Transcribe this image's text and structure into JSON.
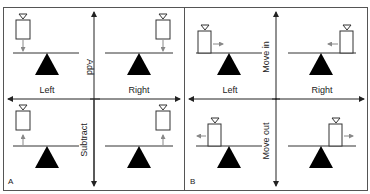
{
  "figure": {
    "panels": [
      {
        "id": "A",
        "label": "A",
        "axis_vertical_top": "Add",
        "axis_vertical_bottom": "Subtract",
        "axis_horizontal_left": "Left",
        "axis_horizontal_right": "Right",
        "quadrants": [
          {
            "position": "top-left",
            "action": "add weight on left",
            "arrow": "down"
          },
          {
            "position": "top-right",
            "action": "add weight on right",
            "arrow": "down"
          },
          {
            "position": "bottom-left",
            "action": "subtract weight on left",
            "arrow": "up"
          },
          {
            "position": "bottom-right",
            "action": "subtract weight on right",
            "arrow": "up"
          }
        ]
      },
      {
        "id": "B",
        "label": "B",
        "axis_vertical_top": "Move in",
        "axis_vertical_bottom": "Move out",
        "axis_horizontal_left": "Left",
        "axis_horizontal_right": "Right",
        "quadrants": [
          {
            "position": "top-left",
            "action": "move weight in from left",
            "arrow": "right"
          },
          {
            "position": "top-right",
            "action": "move weight in from right",
            "arrow": "left"
          },
          {
            "position": "bottom-left",
            "action": "move weight out on left",
            "arrow": "left"
          },
          {
            "position": "bottom-right",
            "action": "move weight out on right",
            "arrow": "right"
          }
        ]
      }
    ],
    "colors": {
      "line": "#222222",
      "arrow_small": "#888888",
      "fulcrum": "#000000",
      "background": "#ffffff"
    }
  }
}
